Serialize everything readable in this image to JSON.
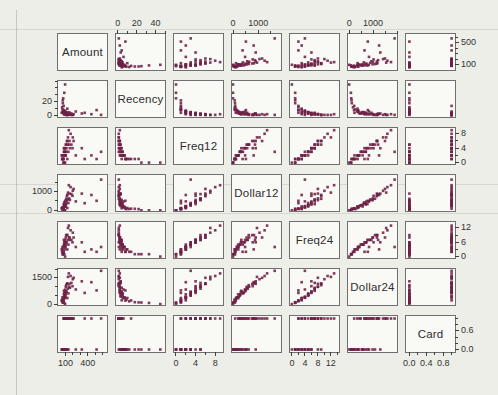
{
  "chart_data": {
    "type": "scatter",
    "subtype": "scatterplot-matrix",
    "grid": "off",
    "legend": "none",
    "page_background": "#edeee8",
    "panel": {
      "background": "#f9f9f6",
      "border_color": "#6f6f6f"
    },
    "marker": {
      "shape": "square",
      "size_px": 2.6,
      "color": "#6d2145"
    },
    "tick_color": "#3f3f3f",
    "diagonal_labels": [
      "Amount",
      "Recency",
      "Freq12",
      "Dollar12",
      "Freq24",
      "Dollar24",
      "Card"
    ],
    "axis_layout": {
      "top_labeled_columns": [
        2,
        4,
        6
      ],
      "left_labeled_rows": [
        2,
        4,
        6
      ],
      "right_labeled_rows": [
        1,
        3,
        5,
        7
      ],
      "bottom_labeled_columns": [
        1,
        3,
        5,
        7
      ]
    },
    "variables": [
      {
        "name": "Amount",
        "min": 0,
        "max": 660,
        "h": {
          "labels": [
            {
              "v": 100,
              "t": "100"
            },
            {
              "v": 400,
              "t": "400"
            }
          ],
          "minors": [
            200,
            300,
            500,
            600
          ]
        },
        "v": {
          "labels": [
            {
              "v": 100,
              "t": "100"
            },
            {
              "v": 500,
              "t": "500"
            }
          ],
          "minors": [
            200,
            300,
            400,
            600
          ]
        }
      },
      {
        "name": "Recency",
        "min": -2,
        "max": 50,
        "h": {
          "labels": [
            {
              "v": 0,
              "t": "0"
            },
            {
              "v": 20,
              "t": "20"
            },
            {
              "v": 40,
              "t": "40"
            }
          ],
          "minors": [
            10,
            30,
            50
          ]
        },
        "v": {
          "labels": [
            {
              "v": 0,
              "t": "0"
            },
            {
              "v": 20,
              "t": "20"
            }
          ],
          "minors": [
            10,
            30,
            40,
            50
          ]
        }
      },
      {
        "name": "Freq12",
        "min": -0.4,
        "max": 9.6,
        "h": {
          "labels": [
            {
              "v": 0,
              "t": "0"
            },
            {
              "v": 4,
              "t": "4"
            },
            {
              "v": 8,
              "t": "8"
            }
          ],
          "minors": [
            2,
            6
          ]
        },
        "v": {
          "labels": [
            {
              "v": 0,
              "t": "0"
            },
            {
              "v": 4,
              "t": "4"
            },
            {
              "v": 8,
              "t": "8"
            }
          ],
          "minors": [
            2,
            6
          ]
        }
      },
      {
        "name": "Dollar12",
        "min": -40,
        "max": 1900,
        "h": {
          "labels": [
            {
              "v": 0,
              "t": "0"
            },
            {
              "v": 1000,
              "t": "1000"
            }
          ],
          "minors": [
            500,
            1500
          ]
        },
        "v": {
          "labels": [
            {
              "v": 0,
              "t": "0"
            },
            {
              "v": 1000,
              "t": "1000"
            }
          ],
          "minors": [
            500,
            1500
          ]
        }
      },
      {
        "name": "Freq24",
        "min": -0.6,
        "max": 14.5,
        "h": {
          "labels": [
            {
              "v": 0,
              "t": "0"
            },
            {
              "v": 4,
              "t": "4"
            },
            {
              "v": 8,
              "t": "8"
            },
            {
              "v": 12,
              "t": "12"
            }
          ],
          "minors": [
            2,
            6,
            10,
            14
          ]
        },
        "v": {
          "labels": [
            {
              "v": 0,
              "t": "0"
            },
            {
              "v": 6,
              "t": "6"
            },
            {
              "v": 12,
              "t": "12"
            }
          ],
          "minors": [
            3,
            9
          ]
        }
      },
      {
        "name": "Dollar24",
        "min": -50,
        "max": 2000,
        "h": {
          "labels": [
            {
              "v": 0,
              "t": "0"
            },
            {
              "v": 1000,
              "t": "1000"
            }
          ],
          "minors": [
            500,
            1500,
            2000
          ]
        },
        "v": {
          "labels": [
            {
              "v": 0,
              "t": "0"
            },
            {
              "v": 1500,
              "t": "1500"
            }
          ],
          "minors": [
            500,
            1000,
            2000
          ]
        }
      },
      {
        "name": "Card",
        "min": -0.08,
        "max": 1.08,
        "h": {
          "labels": [
            {
              "v": 0,
              "t": "0.0"
            },
            {
              "v": 0.4,
              "t": "0.4"
            },
            {
              "v": 0.8,
              "t": "0.8"
            }
          ],
          "minors": [
            0.2,
            0.6,
            1.0
          ]
        },
        "v": {
          "labels": [
            {
              "v": 0,
              "t": "0.0"
            },
            {
              "v": 0.6,
              "t": "0.6"
            }
          ],
          "minors": [
            0.2,
            0.4,
            0.8,
            1.0
          ]
        }
      }
    ],
    "columns": [
      "Amount",
      "Recency",
      "Freq12",
      "Dollar12",
      "Freq24",
      "Dollar24",
      "Card"
    ],
    "observations": [
      [
        95,
        2,
        4,
        480,
        7,
        820,
        1
      ],
      [
        120,
        1,
        6,
        760,
        9,
        1150,
        1
      ],
      [
        80,
        3,
        3,
        290,
        5,
        560,
        0
      ],
      [
        150,
        2,
        5,
        640,
        8,
        990,
        1
      ],
      [
        60,
        5,
        2,
        160,
        4,
        380,
        0
      ],
      [
        200,
        1,
        7,
        1050,
        10,
        1420,
        1
      ],
      [
        110,
        4,
        3,
        350,
        6,
        700,
        0
      ],
      [
        90,
        6,
        2,
        210,
        3,
        340,
        1
      ],
      [
        75,
        8,
        1,
        90,
        2,
        200,
        0
      ],
      [
        130,
        2,
        5,
        580,
        7,
        880,
        1
      ],
      [
        320,
        3,
        4,
        900,
        6,
        1300,
        0
      ],
      [
        55,
        12,
        1,
        70,
        2,
        160,
        0
      ],
      [
        170,
        1,
        8,
        1250,
        11,
        1600,
        1
      ],
      [
        85,
        2,
        4,
        420,
        6,
        640,
        1
      ],
      [
        140,
        5,
        3,
        390,
        5,
        610,
        0
      ],
      [
        100,
        3,
        2,
        230,
        4,
        430,
        1
      ],
      [
        65,
        18,
        1,
        80,
        1,
        110,
        0
      ],
      [
        450,
        2,
        2,
        820,
        3,
        1250,
        1
      ],
      [
        95,
        7,
        2,
        180,
        4,
        390,
        0
      ],
      [
        125,
        1,
        6,
        830,
        9,
        1180,
        1
      ],
      [
        70,
        25,
        0,
        0,
        1,
        90,
        0
      ],
      [
        160,
        4,
        4,
        560,
        7,
        930,
        1
      ],
      [
        105,
        2,
        5,
        540,
        8,
        980,
        0
      ],
      [
        85,
        33,
        0,
        0,
        1,
        70,
        0
      ],
      [
        580,
        1,
        3,
        1650,
        4,
        1900,
        1
      ],
      [
        115,
        3,
        4,
        470,
        6,
        720,
        1
      ],
      [
        60,
        9,
        1,
        60,
        3,
        260,
        0
      ],
      [
        210,
        2,
        6,
        1150,
        8,
        1500,
        1
      ],
      [
        90,
        5,
        3,
        280,
        5,
        520,
        0
      ],
      [
        135,
        1,
        7,
        950,
        12,
        1550,
        1
      ],
      [
        75,
        14,
        1,
        85,
        2,
        210,
        1
      ],
      [
        240,
        6,
        2,
        480,
        4,
        830,
        0
      ],
      [
        100,
        2,
        3,
        310,
        6,
        690,
        1
      ],
      [
        50,
        4,
        2,
        110,
        3,
        220,
        0
      ],
      [
        180,
        3,
        5,
        870,
        7,
        1210,
        1
      ],
      [
        95,
        45,
        0,
        0,
        0,
        0,
        0
      ],
      [
        145,
        2,
        9,
        1350,
        13,
        1750,
        1
      ],
      [
        70,
        7,
        2,
        150,
        4,
        360,
        0
      ],
      [
        360,
        4,
        1,
        380,
        2,
        640,
        1
      ],
      [
        110,
        1,
        5,
        620,
        9,
        1080,
        0
      ],
      [
        85,
        3,
        3,
        260,
        5,
        480,
        1
      ],
      [
        125,
        10,
        1,
        120,
        3,
        350,
        0
      ],
      [
        155,
        2,
        6,
        900,
        8,
        1160,
        1
      ],
      [
        65,
        22,
        1,
        65,
        1,
        100,
        0
      ],
      [
        195,
        1,
        4,
        780,
        6,
        1020,
        1
      ],
      [
        105,
        5,
        2,
        200,
        5,
        560,
        0
      ],
      [
        80,
        2,
        4,
        330,
        7,
        760,
        1
      ],
      [
        520,
        8,
        1,
        510,
        2,
        780,
        0
      ]
    ]
  }
}
